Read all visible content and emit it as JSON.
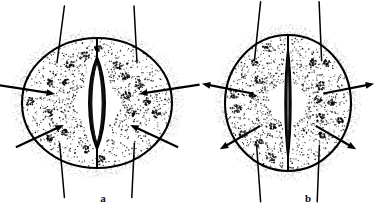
{
  "figure": {
    "background_color": "#ffffff",
    "ink_color": "#000000",
    "width": 391,
    "height": 217
  },
  "panels": [
    {
      "id": "a",
      "label": "a",
      "label_x": 103,
      "label_y": 198,
      "state": "open",
      "description": "Open stoma with turgid guard cells",
      "cell": {
        "center_x": 97,
        "center_y": 103,
        "radius_x": 75,
        "radius_y": 65
      },
      "pore": {
        "aperture": "wide",
        "half_width": 11,
        "half_height": 47
      },
      "arrows": {
        "direction": "inward",
        "count": 4,
        "meaning": "water entering guard cells"
      },
      "spines": 4,
      "chloroplast_count": 18
    },
    {
      "id": "b",
      "label": "b",
      "label_x": 308,
      "label_y": 198,
      "state": "closed",
      "description": "Closed stoma with flaccid guard cells",
      "cell": {
        "center_x": 288,
        "center_y": 103,
        "radius_x": 63,
        "radius_y": 68
      },
      "pore": {
        "aperture": "narrow",
        "half_width": 4,
        "half_height": 56
      },
      "arrows": {
        "direction": "outward",
        "count": 4,
        "meaning": "water leaving guard cells"
      },
      "spines": 4,
      "chloroplast_count": 18
    }
  ],
  "colors": {
    "ink": "#000000",
    "stipple": "#1a1a1a",
    "guard_cell_fill": "#111111",
    "pore_fill": "#ffffff",
    "background": "#ffffff"
  }
}
